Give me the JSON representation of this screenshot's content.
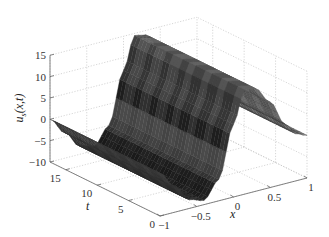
{
  "chart_data": {
    "type": "surface3d",
    "title": "",
    "xlabel": "x",
    "ylabel": "t",
    "zlabel": "u_s(x,t)",
    "zlabel_main": "u",
    "zlabel_sub": "s",
    "zlabel_tail": "(x,t)",
    "xlim": [
      -1,
      1
    ],
    "tlim": [
      0,
      17.5
    ],
    "zlim": [
      -10,
      15
    ],
    "x_ticks": [
      -1,
      -0.5,
      0,
      0.5,
      1
    ],
    "x_tick_labels": [
      "−1",
      "−0.5",
      "0",
      "0.5",
      "1"
    ],
    "t_ticks": [
      0,
      5,
      10,
      15
    ],
    "t_tick_labels": [
      "0",
      "5",
      "10",
      "15"
    ],
    "z_ticks": [
      -10,
      -5,
      0,
      5,
      10,
      15
    ],
    "z_tick_labels": [
      "−10",
      "−5",
      "0",
      "5",
      "10",
      "15"
    ],
    "grid": true,
    "colormap": "gray",
    "profile_x": [
      -1.0,
      -0.8,
      -0.6,
      -0.4,
      -0.2,
      0.0,
      0.15,
      0.3,
      0.5,
      0.7,
      0.85,
      1.0
    ],
    "profile_u": [
      0,
      -4,
      -8,
      -9,
      -5,
      7,
      14.5,
      14,
      10,
      4,
      1,
      0
    ]
  }
}
